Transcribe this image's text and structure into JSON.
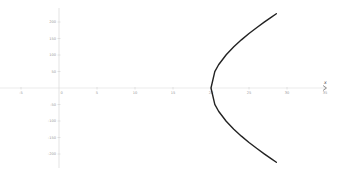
{
  "chart_data": {
    "type": "line",
    "title": "",
    "xlabel": "x",
    "ylabel": "",
    "xlim": [
      -7.7,
      37
    ],
    "ylim": [
      -260,
      265
    ],
    "grid": false,
    "legend": null,
    "x_ticks": [
      -5,
      0,
      5,
      10,
      15,
      20,
      25,
      30,
      35
    ],
    "x_tick_labels": [
      "-5",
      "0",
      "5",
      "10",
      "15",
      "20",
      "25",
      "30",
      "35"
    ],
    "y_ticks": [
      200,
      150,
      100,
      50,
      -50,
      -100,
      -150,
      -200
    ],
    "y_tick_labels": [
      "200",
      "150",
      "100",
      "50",
      "-50",
      "-100",
      "-150",
      "-200"
    ],
    "series": [
      {
        "name": "hyperbola right branch",
        "color": "#222222",
        "x": [
          28.6,
          28,
          27,
          26,
          25,
          24,
          23,
          22,
          21,
          20.5,
          20,
          20.5,
          21,
          22,
          23,
          24,
          25,
          26,
          27,
          28,
          28.6
        ],
        "y": [
          225,
          215.6,
          199.5,
          182.7,
          165,
          145.9,
          124.9,
          100.8,
          70.4,
          49.5,
          0,
          -49.5,
          -70.4,
          -100.8,
          -124.9,
          -145.9,
          -165,
          -182.7,
          -199.5,
          -215.6,
          -225
        ]
      }
    ],
    "annotations": [
      "x"
    ]
  },
  "colors": {
    "axis": "#d9d9d9",
    "curve": "#222222",
    "tick_label": "#9a9a9a"
  }
}
